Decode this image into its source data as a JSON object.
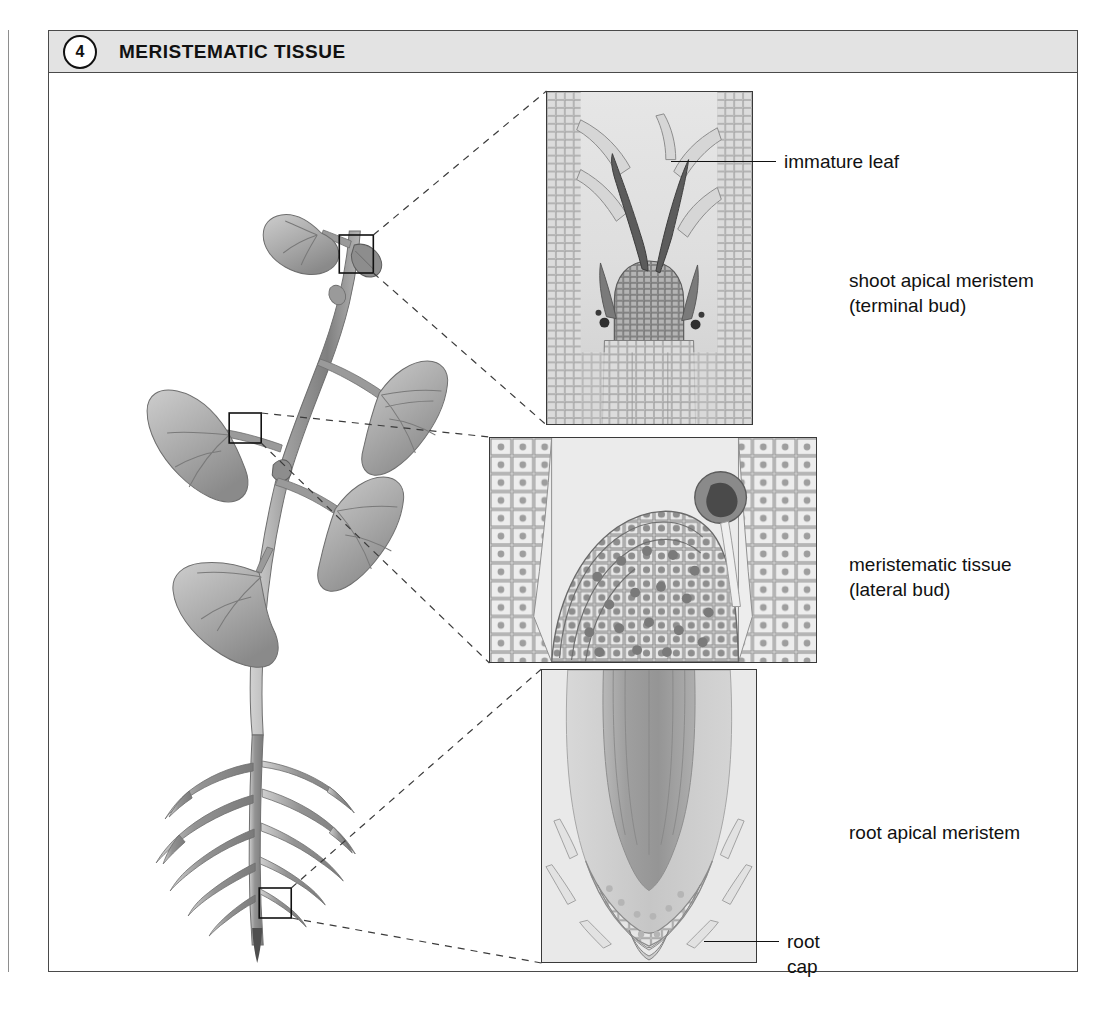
{
  "figure": {
    "number": "4",
    "title": "MERISTEMATIC TISSUE"
  },
  "labels": {
    "immature_leaf": "immature leaf",
    "shoot_apical_meristem": "shoot apical meristem\n(terminal bud)",
    "meristematic_tissue": "meristematic tissue\n(lateral bud)",
    "root_apical_meristem": "root apical meristem",
    "root_cap": "root\ncap"
  },
  "panels": {
    "shoot": {
      "name": "shoot apical meristem micrograph",
      "caption": "shoot apical meristem\n(terminal bud)"
    },
    "lateral": {
      "name": "lateral bud meristem micrograph",
      "caption": "meristematic tissue\n(lateral bud)"
    },
    "root": {
      "name": "root apical meristem micrograph",
      "caption": "root apical meristem"
    }
  },
  "illustration": {
    "name": "whole plant diagram",
    "callouts": [
      {
        "id": "terminal-bud",
        "label": "terminal bud callout box"
      },
      {
        "id": "lateral-bud",
        "label": "lateral bud callout box"
      },
      {
        "id": "root-tip",
        "label": "root tip callout box"
      }
    ]
  },
  "colors": {
    "header_fill": "#e3e3e3",
    "frame_stroke": "#4a4a4a",
    "text": "#111111",
    "plant_stem": "#9a9a9a",
    "plant_leaf": "#b0b0b0"
  }
}
